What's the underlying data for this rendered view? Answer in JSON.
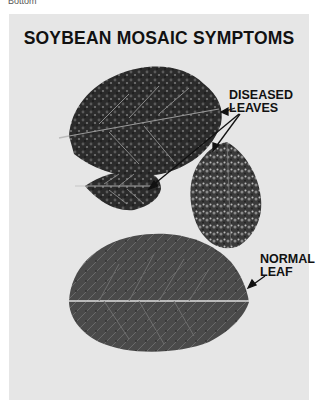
{
  "page": {
    "top_label": "Bottom",
    "title": "SOYBEAN MOSAIC SYMPTOMS",
    "labels": {
      "diseased_line1": "DISEASED",
      "diseased_line2": "LEAVES",
      "normal_line1": "NORMAL",
      "normal_line2": "LEAF"
    },
    "colors": {
      "panel": "#e6e6e6",
      "text": "#111111",
      "leaf_dark": "#2a2a2a",
      "leaf_normal": "#4a4a4a"
    }
  }
}
